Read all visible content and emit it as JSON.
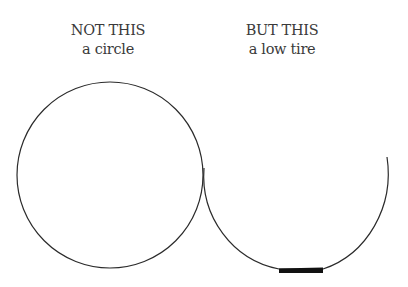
{
  "diagram": {
    "left": {
      "heading": "NOT THIS",
      "caption": "a circle",
      "shape": "circle"
    },
    "right": {
      "heading": "BUT THIS",
      "caption": "a low tire",
      "shape": "open arc with flattened bottom contact patch"
    },
    "colors": {
      "stroke": "#2b2b2b",
      "text": "#3a3a3a",
      "background": "#ffffff",
      "patch": "#111111"
    }
  }
}
